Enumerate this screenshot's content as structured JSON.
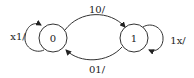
{
  "diagram": {
    "type": "state-machine",
    "states": [
      {
        "id": "s0",
        "label": "0"
      },
      {
        "id": "s1",
        "label": "1"
      }
    ],
    "transitions": [
      {
        "from": "0",
        "to": "1",
        "label": "10/"
      },
      {
        "from": "1",
        "to": "0",
        "label": "01/"
      },
      {
        "from": "0",
        "to": "0",
        "label": "x1/"
      },
      {
        "from": "1",
        "to": "1",
        "label": "1x/"
      }
    ],
    "colors": {
      "stroke": "#333333",
      "text": "#222222",
      "background": "#ffffff"
    }
  }
}
